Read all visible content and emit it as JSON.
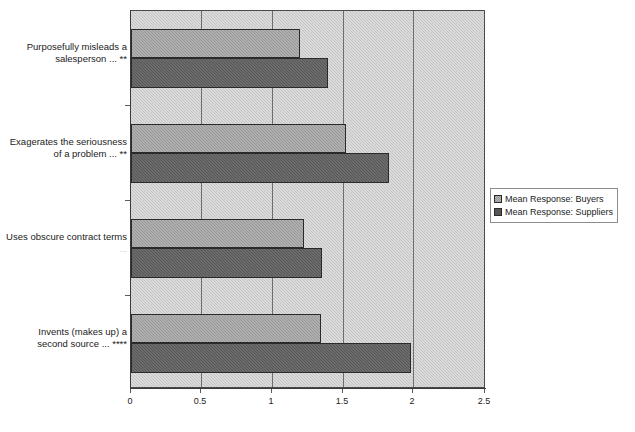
{
  "chart_data": {
    "type": "bar",
    "orientation": "horizontal",
    "title": "",
    "xlabel": "",
    "ylabel": "",
    "xlim": [
      0,
      2.5
    ],
    "xticks": [
      "0",
      "0.5",
      "1",
      "1.5",
      "2",
      "2.5"
    ],
    "xtick_values": [
      0,
      0.5,
      1,
      1.5,
      2,
      2.5
    ],
    "grid": true,
    "grid_axis": "x",
    "legend_position": "right",
    "categories": [
      "Purposefully misleads a salesperson ... **",
      "Exagerates the seriousness of a problem ... **",
      "Uses obscure contract terms ...",
      "Invents (makes up) a second source ... ****"
    ],
    "category_lines": [
      [
        "Purposefully misleads a",
        "salesperson ... **"
      ],
      [
        "Exagerates the seriousness",
        "of a problem ... **"
      ],
      [
        "Uses obscure contract terms",
        "..."
      ],
      [
        "Invents (makes up) a",
        "second source ... ****"
      ]
    ],
    "series": [
      {
        "name": "Mean Response: Buyers",
        "values": [
          1.19,
          1.52,
          1.22,
          1.34
        ],
        "color": "#989898"
      },
      {
        "name": "Mean Response: Suppliers",
        "values": [
          1.39,
          1.82,
          1.35,
          1.98
        ],
        "color": "#565656"
      }
    ]
  },
  "legend": {
    "items": [
      {
        "label": "Mean Response: Buyers",
        "swatch": "buyers"
      },
      {
        "label": "Mean Response: Suppliers",
        "swatch": "suppliers"
      }
    ]
  },
  "axis": {
    "tick_labels": [
      "0",
      "0.5",
      "1",
      "1.5",
      "2",
      "2.5"
    ]
  },
  "colors": {
    "plot_background": "#c3c3c3",
    "buyers_bar": "#989898",
    "suppliers_bar": "#565656",
    "gridline": "#6e6e6e",
    "axis_line": "#3a3a3a",
    "text": "#1b1b1b",
    "page_background": "#ffffff"
  }
}
